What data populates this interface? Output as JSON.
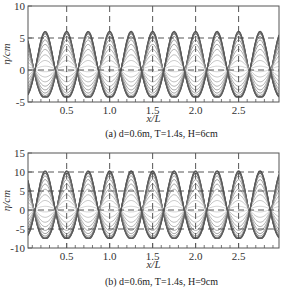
{
  "chart_data": [
    {
      "type": "line",
      "panel": "a",
      "caption_prefix": "(a)",
      "caption": "(a) d=0.6m, T=1.4s, H=6cm",
      "caption_parts": {
        "d": "0.6m",
        "T": "1.4s",
        "H": "6cm"
      },
      "xlabel": "x/L",
      "ylabel": "η/cm",
      "xlim": [
        0.05,
        2.97
      ],
      "ylim": [
        -5,
        10
      ],
      "xticks": [
        0.5,
        1.0,
        1.5,
        2.0,
        2.5
      ],
      "xtick_labels": [
        "0.5",
        "1.0",
        "1.5",
        "2.0",
        "2.5"
      ],
      "yticks": [
        -5,
        0,
        5,
        10
      ],
      "ytick_labels": [
        "-5",
        "0",
        "5",
        "10"
      ],
      "grid": {
        "vertical_dashed_at": [
          0.5,
          1.0,
          1.5,
          2.0,
          2.5
        ],
        "horizontal_dashed_at": [
          0,
          5
        ]
      },
      "description": "Family of standing-wave surface profiles over time; antinodes at x/L = 0, 0.5, 1.0, 1.5, 2.0, 2.5, nodes near x/L ≈ 0.22, 0.72, 1.22, 1.72, 2.22, 2.72",
      "envelope": {
        "crest_max": 6.3,
        "trough_min": -4.2,
        "mean_level": 0.5
      },
      "num_profiles": 20
    },
    {
      "type": "line",
      "panel": "b",
      "caption_prefix": "(b)",
      "caption": "(b) d=0.6m, T=1.4s, H=9cm",
      "caption_parts": {
        "d": "0.6m",
        "T": "1.4s",
        "H": "9cm"
      },
      "xlabel": "x/L",
      "ylabel": "η/cm",
      "xlim": [
        0.05,
        2.97
      ],
      "ylim": [
        -10,
        15
      ],
      "xticks": [
        0.5,
        1.0,
        1.5,
        2.0,
        2.5
      ],
      "xtick_labels": [
        "0.5",
        "1.0",
        "1.5",
        "2.0",
        "2.5"
      ],
      "yticks": [
        -10,
        -5,
        0,
        5,
        10,
        15
      ],
      "ytick_labels": [
        "-10",
        "-5",
        "0",
        "5",
        "10",
        "15"
      ],
      "grid": {
        "vertical_dashed_at": [
          0.5,
          1.0,
          1.5,
          2.0,
          2.5
        ],
        "horizontal_dashed_at": [
          -5,
          0,
          5,
          10
        ]
      },
      "description": "Family of standing-wave surface profiles over time; antinodes at x/L = 0, 0.5, 1.0, 1.5, 2.0, 2.5",
      "envelope": {
        "crest_max": 10.5,
        "trough_min": -7.5,
        "mean_level": 0.5
      },
      "num_profiles": 20
    }
  ]
}
